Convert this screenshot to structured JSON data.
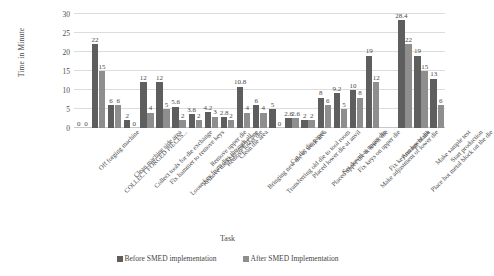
{
  "chart_data": {
    "type": "bar",
    "title": "",
    "xlabel": "Task",
    "ylabel": "Time in Minute",
    "ylim": [
      0,
      30
    ],
    "yticks": [
      0,
      5,
      10,
      15,
      20,
      25,
      30
    ],
    "grid": true,
    "legend_position": "bottom",
    "categories": [
      "Off forging machine",
      "COLLECT FORGED PIECES...",
      "Clean machine side area",
      "Collect tools for die exchange",
      "Fix hammer to remove keys",
      "Loose key from dies through all...",
      "Remove the keys one by one",
      "Remove upper die",
      "Remove lower die",
      "Clean die area",
      "Bringing new die to work area",
      "Transferring old die to tool room",
      "Cut the die paper",
      "Placed lower die at anvil",
      "Placed upper die at lower die",
      "Set dowel at upper die",
      "Fix keys on upper die",
      "Make adjustment of lower die",
      "Fix key on lower die",
      "Arrange blank",
      "Place hot metal block on the die",
      "Make sample test",
      "Start production"
    ],
    "series": [
      {
        "name": "Before SMED implementation",
        "color": "#5e5e5e",
        "values": [
          0,
          22,
          6,
          2,
          12,
          12,
          5.6,
          3.6,
          4.2,
          2.8,
          10.8,
          6,
          5,
          2.6,
          2,
          8,
          9.2,
          10,
          19,
          0,
          28.4,
          19,
          13
        ]
      },
      {
        "name": "After SMED Implementation",
        "color": "#8e8e8e",
        "values": [
          0,
          15,
          6,
          0,
          4,
          5,
          2,
          2,
          3,
          2,
          4,
          4,
          0,
          2.6,
          2,
          6,
          5,
          8,
          12,
          0,
          22,
          15,
          6
        ]
      }
    ],
    "bar_labels": {
      "before": [
        "0",
        "22",
        "6",
        "2",
        "12",
        "12",
        "5.6",
        "3.6",
        "4.2",
        "2.8",
        "10.8",
        "6",
        "5",
        "2.6",
        "2",
        "8",
        "9.2",
        "10",
        "19",
        "",
        "28.4",
        "19",
        "13"
      ],
      "after": [
        "0",
        "15",
        "6",
        "0",
        "4",
        "5",
        "2",
        "2",
        "3",
        "2",
        "4",
        "4",
        "0",
        "2.6",
        "2",
        "6",
        "5",
        "8",
        "12",
        "",
        "22",
        "15",
        "6"
      ]
    }
  }
}
